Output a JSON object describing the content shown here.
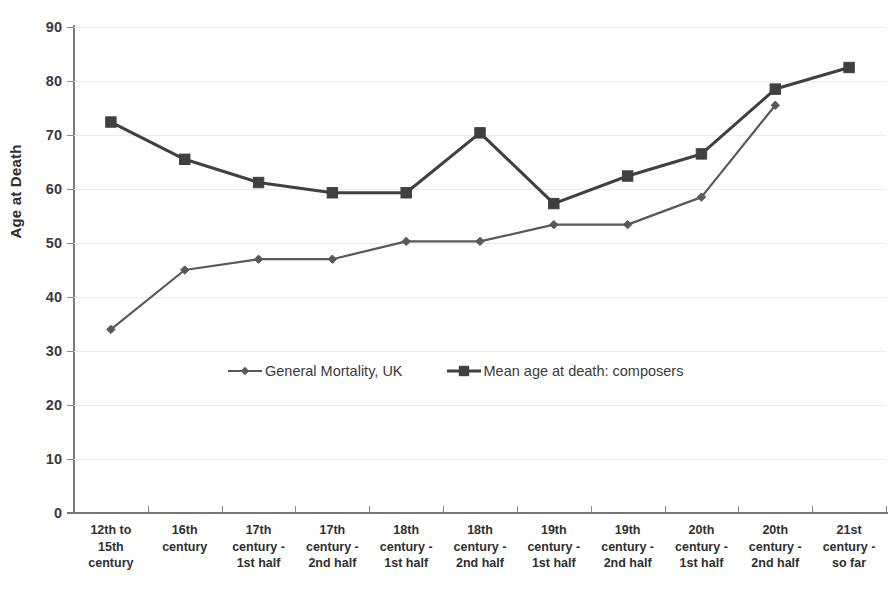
{
  "chart_data": {
    "type": "line",
    "title": "",
    "xlabel": "",
    "ylabel": "Age at Death",
    "ylim": [
      0,
      90
    ],
    "ytick_step": 10,
    "yticks": [
      0,
      10,
      20,
      30,
      40,
      50,
      60,
      70,
      80,
      90
    ],
    "grid": true,
    "grid_axis": "y",
    "legend_position": "inside-bottom-center",
    "categories": [
      "12th to 15th century",
      "16th century",
      "17th century - 1st half",
      "17th century - 2nd half",
      "18th century - 1st half",
      "18th century - 2nd half",
      "19th century - 1st half",
      "19th century - 2nd half",
      "20th century - 1st half",
      "20th century - 2nd half",
      "21st century - so far"
    ],
    "category_lines": [
      [
        "12th to",
        "15th",
        "century"
      ],
      [
        "16th",
        "century"
      ],
      [
        "17th",
        "century -",
        "1st half"
      ],
      [
        "17th",
        "century -",
        "2nd half"
      ],
      [
        "18th",
        "century -",
        "1st half"
      ],
      [
        "18th",
        "century -",
        "2nd half"
      ],
      [
        "19th",
        "century -",
        "1st half"
      ],
      [
        "19th",
        "century -",
        "2nd half"
      ],
      [
        "20th",
        "century -",
        "1st half"
      ],
      [
        "20th",
        "century -",
        "2nd half"
      ],
      [
        "21st",
        "century -",
        "so far"
      ]
    ],
    "series": [
      {
        "name": "General Mortality, UK",
        "marker": "diamond",
        "color": "#595959",
        "values": [
          34.0,
          45.0,
          47.0,
          47.0,
          50.3,
          50.3,
          53.4,
          53.4,
          58.5,
          75.5,
          null
        ]
      },
      {
        "name": "Mean age at death: composers",
        "marker": "square",
        "color": "#404040",
        "values": [
          72.4,
          65.5,
          61.2,
          59.3,
          59.3,
          70.4,
          57.3,
          62.4,
          66.5,
          78.5,
          82.5
        ]
      }
    ]
  },
  "legend": {
    "entries": [
      {
        "label": "General Mortality, UK",
        "marker": "diamond",
        "color": "#595959"
      },
      {
        "label": "Mean age at death: composers",
        "marker": "square",
        "color": "#404040"
      }
    ]
  },
  "axis": {
    "y_title": "Age at Death"
  },
  "colors": {
    "background": "#ffffff",
    "axis": "#7a7a7a",
    "grid": "#eceaea",
    "text": "#3a3a3a",
    "series_general_mortality": "#595959",
    "series_composers": "#404040"
  }
}
